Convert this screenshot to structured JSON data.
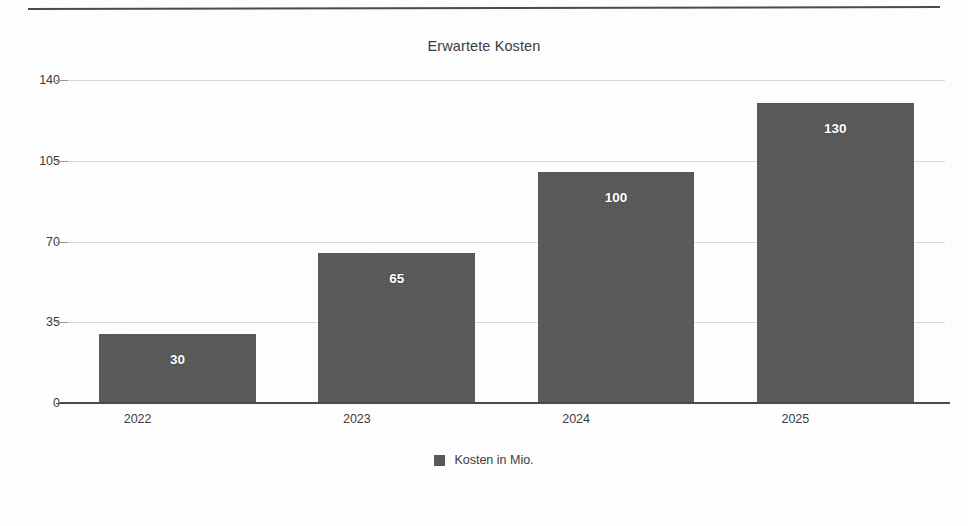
{
  "page": {
    "background_color": "#fdfdfd",
    "top_rule_color": "#4b4b4b"
  },
  "chart_data": {
    "type": "bar",
    "title": "Erwartete Kosten",
    "xlabel": "",
    "ylabel": "",
    "categories": [
      "2022",
      "2023",
      "2024",
      "2025"
    ],
    "values": [
      30,
      65,
      100,
      130
    ],
    "value_labels": [
      "30",
      "65",
      "100",
      "130"
    ],
    "ylim": [
      0,
      140
    ],
    "y_ticks": [
      0,
      35,
      70,
      105,
      140
    ],
    "y_tick_labels": [
      "0",
      "35",
      "70",
      "105",
      "140"
    ],
    "grid": true,
    "grid_color": "#d8d8d8",
    "axis_color": "#4a4a4a",
    "bar_color": "#585858",
    "value_label_color": "#ffffff",
    "legend": {
      "position": "bottom",
      "entries": [
        {
          "label": "Kosten in Mio.",
          "color": "#585858"
        }
      ]
    },
    "series": [
      {
        "name": "Kosten in Mio.",
        "color": "#585858",
        "values": [
          30,
          65,
          100,
          130
        ]
      }
    ]
  }
}
